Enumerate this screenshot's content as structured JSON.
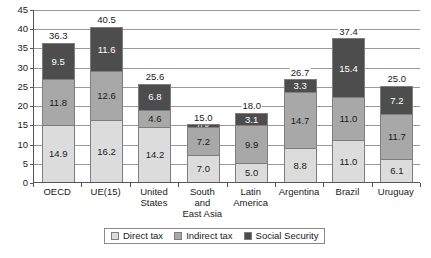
{
  "chart_data": {
    "type": "bar",
    "subtype": "stacked-bar",
    "title": "",
    "xlabel": "",
    "ylabel": "",
    "ylim": [
      0,
      45
    ],
    "ytick_step": 5,
    "yticks": [
      "0",
      "5",
      "10",
      "15",
      "20",
      "25",
      "30",
      "35",
      "40",
      "45"
    ],
    "grid": true,
    "grid_axis": "y",
    "legend_position": "bottom",
    "categories": [
      "OECD",
      "UE(15)",
      "United States",
      "South and East Asia",
      "Latin America",
      "Argentina",
      "Brazil",
      "Uruguay"
    ],
    "category_label_lines": [
      [
        "OECD"
      ],
      [
        "UE(15)"
      ],
      [
        "United",
        "States"
      ],
      [
        "South",
        "and",
        "East Asia"
      ],
      [
        "Latin",
        "America"
      ],
      [
        "Argentina"
      ],
      [
        "Brazil"
      ],
      [
        "Uruguay"
      ]
    ],
    "series": [
      {
        "name": "Direct tax",
        "color": "#dcdcdc",
        "values": [
          14.9,
          16.2,
          14.2,
          7.0,
          5.0,
          8.8,
          11.0,
          6.1
        ],
        "labels": [
          "14.9",
          "16.2",
          "14.2",
          "7.0",
          "5.0",
          "8.8",
          "11.0",
          "6.1"
        ]
      },
      {
        "name": "Indirect tax",
        "color": "#a8a8a8",
        "values": [
          11.8,
          12.6,
          4.6,
          7.2,
          9.9,
          14.7,
          11.0,
          11.7
        ],
        "labels": [
          "11.8",
          "12.6",
          "4.6",
          "7.2",
          "9.9",
          "14.7",
          "11.0",
          "11.7"
        ]
      },
      {
        "name": "Social Security",
        "color": "#4d4d4d",
        "values": [
          9.5,
          11.6,
          6.8,
          0.8,
          3.1,
          3.3,
          15.4,
          7.2
        ],
        "labels": [
          "9.5",
          "11.6",
          "6.8",
          "0.8",
          "3.1",
          "3.3",
          "15.4",
          "7.2"
        ]
      }
    ],
    "totals": [
      36.3,
      40.5,
      25.6,
      15.0,
      18.0,
      26.7,
      37.4,
      25.0
    ],
    "total_labels": [
      "36.3",
      "40.5",
      "25.6",
      "15.0",
      "18.0",
      "26.7",
      "37.4",
      "25.0"
    ]
  },
  "legend": {
    "items": [
      {
        "label": "Direct tax",
        "swatch": "direct"
      },
      {
        "label": "Indirect tax",
        "swatch": "indirect"
      },
      {
        "label": "Social Security",
        "swatch": "social"
      }
    ]
  },
  "colors": {
    "direct_tax": "#dcdcdc",
    "indirect_tax": "#a8a8a8",
    "social_security": "#4d4d4d",
    "gridline": "#9a9a9a",
    "axis": "#555555",
    "background": "#ffffff"
  }
}
